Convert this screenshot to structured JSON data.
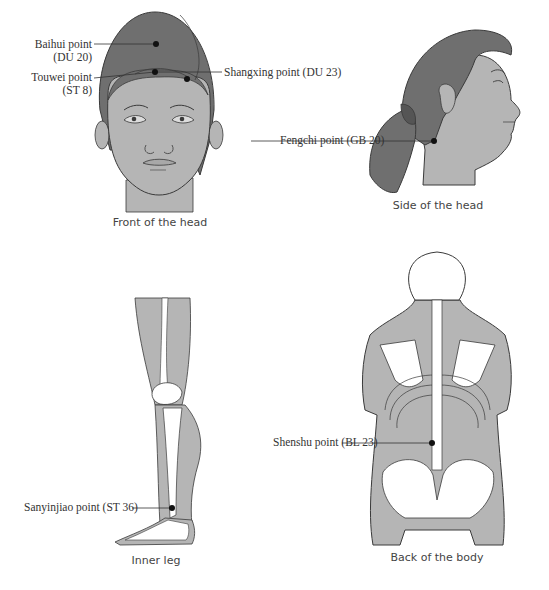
{
  "diagram": {
    "colors": {
      "hair": "#6f6f6f",
      "skin": "#b5b5b5",
      "bone": "#ffffff",
      "outline": "#3a3a3a",
      "point": "#111111",
      "background": "#ffffff"
    },
    "panels": [
      {
        "id": "front-head",
        "caption": "Front of the head",
        "points": [
          {
            "name": "Baihui point",
            "code": "(DU 20)"
          },
          {
            "name": "Touwei point",
            "code": "(ST 8)"
          },
          {
            "name": "Shangxing point (DU 23)"
          }
        ]
      },
      {
        "id": "side-head",
        "caption": "Side of the head",
        "points": [
          {
            "name": "Fengchi point (GB 20)"
          }
        ]
      },
      {
        "id": "inner-leg",
        "caption": "Inner leg",
        "points": [
          {
            "name": "Sanyinjiao point (ST 36)"
          }
        ]
      },
      {
        "id": "back-body",
        "caption": "Back of the body",
        "points": [
          {
            "name": "Shenshu point (BL 23)"
          }
        ]
      }
    ]
  }
}
